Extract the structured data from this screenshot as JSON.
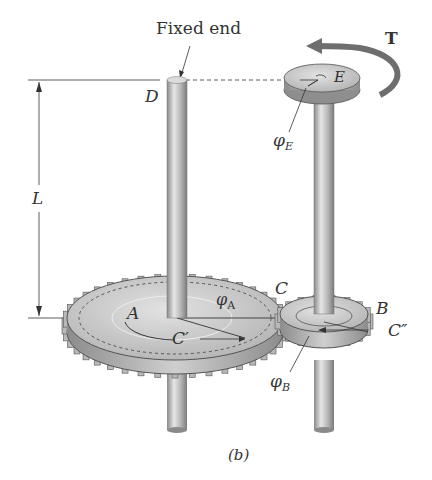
{
  "figure": {
    "caption": "(b)",
    "labels": {
      "fixed_end": "Fixed end",
      "torque": "T",
      "point_D": "D",
      "point_E": "E",
      "length": "L",
      "gear_A": "A",
      "gear_B": "B",
      "point_C": "C",
      "point_C_prime": "C′",
      "point_C_double_prime": "C″",
      "phi": "φ",
      "phi_A_sub": "A",
      "phi_B_sub": "B",
      "phi_E_sub": "E"
    },
    "colors": {
      "shaft": "#bdbdbd",
      "gear": "#c8c8c8",
      "gear_edge": "#555555",
      "torque_arrow": "#6e6e6e",
      "text": "#333333"
    }
  }
}
